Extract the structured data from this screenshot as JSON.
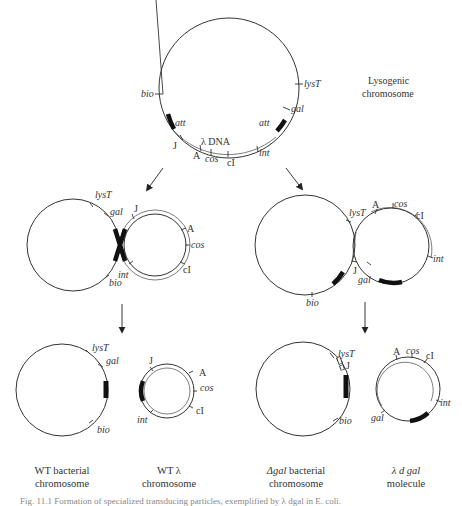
{
  "figure": {
    "top": {
      "title_line1": "Lysogenic",
      "title_line2": "chromosome",
      "labels": {
        "bio": "bio",
        "lysT": "lysT",
        "gal": "gal",
        "att_left": "att",
        "att_right": "att",
        "J": "J",
        "lambda_dna": "λ DNA",
        "A": "A",
        "cos": "cos",
        "cI": "cI",
        "int": "int"
      }
    },
    "middle_left": {
      "labels": {
        "lysT": "lysT",
        "gal": "gal",
        "bio": "bio",
        "int": "int",
        "J": "J",
        "A": "A",
        "cos": "cos",
        "cI": "cI"
      }
    },
    "middle_right": {
      "labels": {
        "lysT": "lysT",
        "bio": "bio",
        "J": "J",
        "gal": "gal",
        "A": "A",
        "cos": "cos",
        "cI": "cI",
        "int": "int"
      }
    },
    "bottom": {
      "wt_bacterial": {
        "labels": {
          "lysT": "lysT",
          "gal": "gal",
          "bio": "bio"
        },
        "caption_line1": "WT bacterial",
        "caption_line2": "chromosome"
      },
      "wt_lambda": {
        "labels": {
          "J": "J",
          "A": "A",
          "cos": "cos",
          "cI": "cI",
          "int": "int"
        },
        "caption_line1": "WT λ",
        "caption_line2": "chromosome"
      },
      "dgal_bacterial": {
        "labels": {
          "lysT": "lysT",
          "J": "J",
          "bio": "bio"
        },
        "caption_prefix": "Δgal",
        "caption_line1_rest": " bacterial",
        "caption_line2": "chromosome"
      },
      "lambda_dgal": {
        "labels": {
          "A": "A",
          "cos": "cos",
          "cI": "cI",
          "int": "int",
          "gal": "gal"
        },
        "caption_line1": "λ d gal",
        "caption_line2": "molecule"
      }
    },
    "footer_caption": "Fig. 11.1  Formation of specialized transducing particles, exemplified by λ dgal in E. coli."
  }
}
